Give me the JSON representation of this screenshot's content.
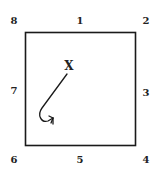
{
  "diagram": {
    "type": "square-with-numbered-positions",
    "positions": {
      "top_left": "8",
      "top_center": "1",
      "top_right": "2",
      "right_center": "3",
      "bottom_right": "4",
      "bottom_center": "5",
      "bottom_left": "6",
      "left_center": "7"
    },
    "marker": "X",
    "arrow": "curved path from X toward lower-left, hooking back right"
  }
}
